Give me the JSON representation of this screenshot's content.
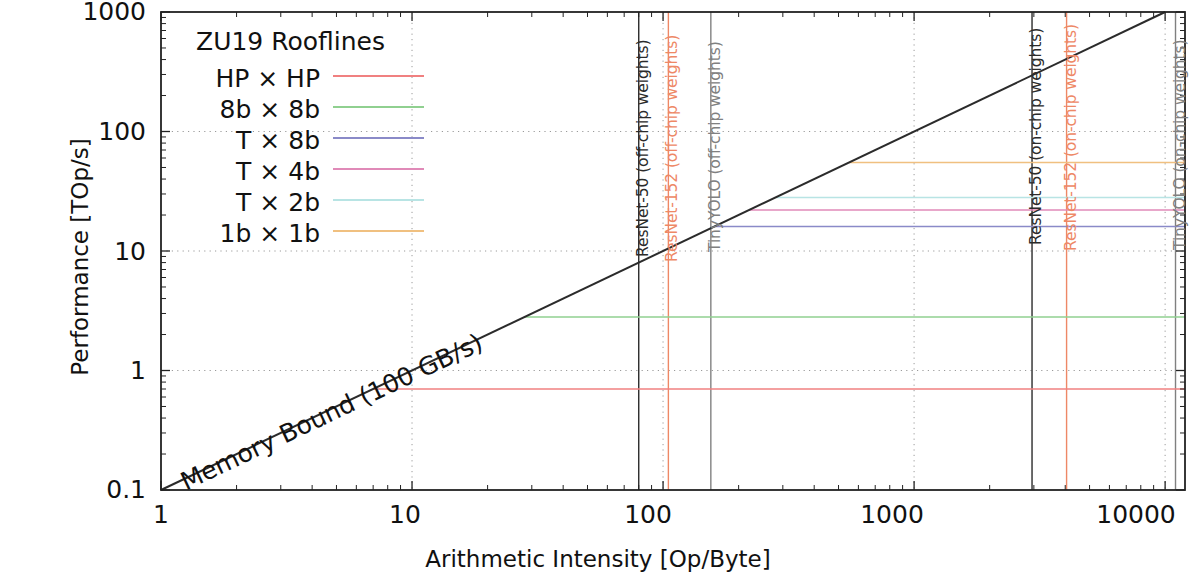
{
  "chart_data": {
    "type": "line",
    "title": "ZU19 Rooflines",
    "xlabel": "Arithmetic Intensity [Op/Byte]",
    "ylabel": "Performance [TOp/s]",
    "xscale": "log",
    "yscale": "log",
    "xlim": [
      1,
      12000
    ],
    "ylim": [
      0.1,
      1000
    ],
    "xticks": [
      "1",
      "10",
      "100",
      "1000",
      "10000"
    ],
    "xtick_values": [
      1,
      10,
      100,
      1000,
      10000
    ],
    "yticks": [
      "0.1",
      "1",
      "10",
      "100",
      "1000"
    ],
    "ytick_values": [
      0.1,
      1,
      10,
      100,
      1000
    ],
    "grid": "dotted major gridlines both axes",
    "legend_position": "upper left inside axes",
    "memory_bandwidth_GBps": 100,
    "memory_bound_label": "Memory Bound (100 GB/s)",
    "memory_bound_line": {
      "name": "Memory Bound (100 GB/s)",
      "color": "#2b2b2b",
      "from": [
        1,
        0.1
      ],
      "to": [
        10000,
        1000
      ]
    },
    "series": [
      {
        "name": "HP × HP",
        "peak": 0.7,
        "knee_x": 7.0,
        "color": "#f08080"
      },
      {
        "name": "8b × 8b",
        "peak": 2.8,
        "knee_x": 28.0,
        "color": "#90d090"
      },
      {
        "name": "T × 8b",
        "peak": 16.0,
        "knee_x": 160.0,
        "color": "#8a8ac8"
      },
      {
        "name": "T × 4b",
        "peak": 22.0,
        "knee_x": 220.0,
        "color": "#e08ab8"
      },
      {
        "name": "T × 2b",
        "peak": 28.0,
        "knee_x": 280.0,
        "color": "#b8e4e4"
      },
      {
        "name": "1b × 1b",
        "peak": 55.0,
        "knee_x": 550.0,
        "color": "#f0c080"
      }
    ],
    "vertical_markers": [
      {
        "label": "ResNet-50 (off-chip weights)",
        "x": 80,
        "color": "#2b2b2b"
      },
      {
        "label": "ResNet-152 (off-chip weights)",
        "x": 105,
        "color": "#ee8866"
      },
      {
        "label": "TinyYOLO (off-chip weights)",
        "x": 155,
        "color": "#808080"
      },
      {
        "label": "ResNet-50 (on-chip weights)",
        "x": 2950,
        "color": "#2b2b2b"
      },
      {
        "label": "ResNet-152 (on-chip weights)",
        "x": 4050,
        "color": "#ee8866"
      },
      {
        "label": "TinyYOLO (on-chip weights)",
        "x": 11000,
        "color": "#808080"
      }
    ]
  },
  "legend": {
    "title": "ZU19 Rooflines",
    "items": [
      {
        "label": "HP × HP"
      },
      {
        "label": "8b × 8b"
      },
      {
        "label": "T × 8b"
      },
      {
        "label": "T × 4b"
      },
      {
        "label": "T × 2b"
      },
      {
        "label": "1b × 1b"
      }
    ]
  },
  "axes": {
    "x_title": "Arithmetic Intensity [Op/Byte]",
    "y_title": "Performance [TOp/s]"
  }
}
